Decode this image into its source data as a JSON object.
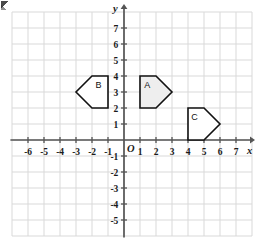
{
  "figure": {
    "type": "coordinate-grid",
    "width": 255,
    "height": 245,
    "background_color": "#ffffff",
    "grid": {
      "visible": true,
      "cell_size_px": 16,
      "color": "#d9d9d9",
      "x_min": -7,
      "x_max": 8,
      "y_min": -6,
      "y_max": 8
    },
    "origin": {
      "label": "O",
      "px_x": 124,
      "px_y": 140
    },
    "axes": {
      "x": {
        "name": "x",
        "color": "#555555",
        "arrow": true,
        "tick_labels": [
          "-6",
          "-5",
          "-4",
          "-3",
          "-2",
          "-1",
          "1",
          "2",
          "3",
          "4",
          "5",
          "6",
          "7"
        ],
        "tick_values": [
          -6,
          -5,
          -4,
          -3,
          -2,
          -1,
          1,
          2,
          3,
          4,
          5,
          6,
          7
        ]
      },
      "y": {
        "name": "y",
        "color": "#555555",
        "arrow": true,
        "tick_labels": [
          "7",
          "6",
          "5",
          "4",
          "3",
          "2",
          "1",
          "-1",
          "-2",
          "-3",
          "-4",
          "-5"
        ],
        "tick_values": [
          7,
          6,
          5,
          4,
          3,
          2,
          1,
          -1,
          -2,
          -3,
          -4,
          -5
        ]
      }
    },
    "shapes": [
      {
        "label": "A",
        "label_point": [
          1.45,
          3.45
        ],
        "fill": "#eeeeee",
        "stroke": "#111111",
        "stroke_width": 1.6,
        "vertices": [
          [
            1,
            2
          ],
          [
            1,
            4
          ],
          [
            2,
            4
          ],
          [
            3,
            3
          ],
          [
            2,
            2
          ]
        ]
      },
      {
        "label": "B",
        "label_point": [
          -1.6,
          3.45
        ],
        "fill": "#ffffff",
        "stroke": "#111111",
        "stroke_width": 1.6,
        "vertices": [
          [
            -1,
            2
          ],
          [
            -1,
            4
          ],
          [
            -2,
            4
          ],
          [
            -3,
            3
          ],
          [
            -2,
            2
          ]
        ]
      },
      {
        "label": "C",
        "label_point": [
          4.4,
          1.45
        ],
        "fill": "#ffffff",
        "stroke": "#111111",
        "stroke_width": 1.6,
        "vertices": [
          [
            4,
            0
          ],
          [
            4,
            2
          ],
          [
            5,
            2
          ],
          [
            6,
            1
          ],
          [
            5,
            0
          ]
        ]
      }
    ]
  },
  "chart_data": {
    "type": "scatter",
    "title": "",
    "xlabel": "x",
    "ylabel": "y",
    "xlim": [
      -7,
      8
    ],
    "ylim": [
      -6,
      8
    ],
    "grid": true,
    "legend": "none",
    "annotations": [
      "A",
      "B",
      "C",
      "O"
    ],
    "series": [
      {
        "name": "A",
        "shape": "pentagon",
        "filled": true,
        "x": [
          1,
          1,
          2,
          3,
          2
        ],
        "y": [
          2,
          4,
          4,
          3,
          2
        ]
      },
      {
        "name": "B",
        "shape": "pentagon",
        "filled": false,
        "x": [
          -1,
          -1,
          -2,
          -3,
          -2
        ],
        "y": [
          2,
          4,
          4,
          3,
          2
        ]
      },
      {
        "name": "C",
        "shape": "pentagon",
        "filled": false,
        "x": [
          4,
          4,
          5,
          6,
          5
        ],
        "y": [
          0,
          2,
          2,
          1,
          0
        ]
      }
    ]
  }
}
